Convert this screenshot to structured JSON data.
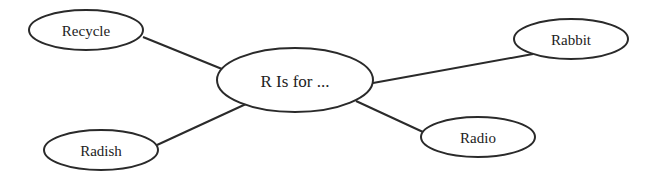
{
  "diagram": {
    "type": "concept-map",
    "colors": {
      "stroke": "#2a2a2a",
      "fill": "#ffffff",
      "text": "#222222"
    },
    "center": {
      "id": "center",
      "label": "R Is for ...",
      "cx": 295,
      "cy": 80,
      "rx": 78,
      "ry": 32,
      "font_size": 17
    },
    "nodes": [
      {
        "id": "recycle",
        "label": "Recycle",
        "cx": 86,
        "cy": 30,
        "rx": 57,
        "ry": 20,
        "font_size": 15
      },
      {
        "id": "rabbit",
        "label": "Rabbit",
        "cx": 571,
        "cy": 39,
        "rx": 57,
        "ry": 20,
        "font_size": 15
      },
      {
        "id": "radio",
        "label": "Radio",
        "cx": 478,
        "cy": 137,
        "rx": 57,
        "ry": 20,
        "font_size": 15
      },
      {
        "id": "radish",
        "label": "Radish",
        "cx": 101,
        "cy": 150,
        "rx": 57,
        "ry": 20,
        "font_size": 15
      }
    ],
    "edges": [
      {
        "from": "recycle",
        "to": "center",
        "x1": 143,
        "y1": 37,
        "x2": 222,
        "y2": 69
      },
      {
        "from": "rabbit",
        "to": "center",
        "x1": 533,
        "y1": 54,
        "x2": 373,
        "y2": 83
      },
      {
        "from": "radio",
        "to": "center",
        "x1": 423,
        "y1": 132,
        "x2": 356,
        "y2": 101
      },
      {
        "from": "radish",
        "to": "center",
        "x1": 157,
        "y1": 145,
        "x2": 246,
        "y2": 104
      }
    ]
  }
}
